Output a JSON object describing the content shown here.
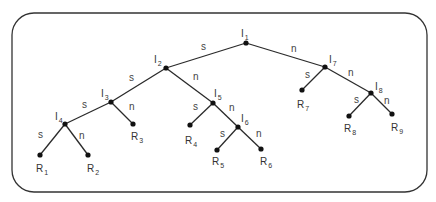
{
  "diagram": {
    "type": "binary-decision-tree",
    "border": {
      "x": 12,
      "y": 13,
      "w": 415,
      "h": 179,
      "radius": 22,
      "color": "#333333"
    },
    "internal_nodes": [
      {
        "id": "I1",
        "base": "I",
        "sub": "1",
        "x": 246,
        "y": 43,
        "lx": 241,
        "ly": 37
      },
      {
        "id": "I2",
        "base": "I",
        "sub": "2",
        "x": 166,
        "y": 68,
        "lx": 154,
        "ly": 63
      },
      {
        "id": "I3",
        "base": "I",
        "sub": "3",
        "x": 111,
        "y": 102,
        "lx": 101,
        "ly": 97
      },
      {
        "id": "I4",
        "base": "I",
        "sub": "4",
        "x": 65,
        "y": 124,
        "lx": 55,
        "ly": 120
      },
      {
        "id": "I5",
        "base": "I",
        "sub": "5",
        "x": 213,
        "y": 103,
        "lx": 214,
        "ly": 97
      },
      {
        "id": "I6",
        "base": "I",
        "sub": "6",
        "x": 238,
        "y": 127,
        "lx": 241,
        "ly": 122
      },
      {
        "id": "I7",
        "base": "I",
        "sub": "7",
        "x": 325,
        "y": 67,
        "lx": 329,
        "ly": 63
      },
      {
        "id": "I8",
        "base": "I",
        "sub": "8",
        "x": 371,
        "y": 93,
        "lx": 375,
        "ly": 90
      }
    ],
    "leaf_nodes": [
      {
        "id": "R1",
        "base": "R",
        "sub": "1",
        "x": 40,
        "y": 155,
        "lx": 36,
        "ly": 172
      },
      {
        "id": "R2",
        "base": "R",
        "sub": "2",
        "x": 88,
        "y": 155,
        "lx": 87,
        "ly": 172
      },
      {
        "id": "R3",
        "base": "R",
        "sub": "3",
        "x": 133,
        "y": 124,
        "lx": 131,
        "ly": 140
      },
      {
        "id": "R4",
        "base": "R",
        "sub": "4",
        "x": 190,
        "y": 125,
        "lx": 185,
        "ly": 144
      },
      {
        "id": "R5",
        "base": "R",
        "sub": "5",
        "x": 217,
        "y": 150,
        "lx": 212,
        "ly": 165
      },
      {
        "id": "R6",
        "base": "R",
        "sub": "6",
        "x": 261,
        "y": 149,
        "lx": 260,
        "ly": 165
      },
      {
        "id": "R7",
        "base": "R",
        "sub": "7",
        "x": 302,
        "y": 90,
        "lx": 297,
        "ly": 108
      },
      {
        "id": "R8",
        "base": "R",
        "sub": "8",
        "x": 349,
        "y": 116,
        "lx": 344,
        "ly": 132
      },
      {
        "id": "R9",
        "base": "R",
        "sub": "9",
        "x": 392,
        "y": 114,
        "lx": 391,
        "ly": 131
      }
    ],
    "edges": [
      {
        "from": "I1",
        "to": "I2",
        "label": "s",
        "lx": 201,
        "ly": 50
      },
      {
        "from": "I1",
        "to": "I7",
        "label": "n",
        "lx": 291,
        "ly": 52
      },
      {
        "from": "I2",
        "to": "I3",
        "label": "s",
        "lx": 129,
        "ly": 81
      },
      {
        "from": "I2",
        "to": "I5",
        "label": "n",
        "lx": 193,
        "ly": 80
      },
      {
        "from": "I3",
        "to": "I4",
        "label": "s",
        "lx": 82,
        "ly": 108
      },
      {
        "from": "I3",
        "to": "R3",
        "label": "n",
        "lx": 129,
        "ly": 110
      },
      {
        "from": "I4",
        "to": "R1",
        "label": "s",
        "lx": 38,
        "ly": 138
      },
      {
        "from": "I4",
        "to": "R2",
        "label": "n",
        "lx": 79,
        "ly": 139
      },
      {
        "from": "I5",
        "to": "R4",
        "label": "s",
        "lx": 193,
        "ly": 110
      },
      {
        "from": "I5",
        "to": "I6",
        "label": "n",
        "lx": 229,
        "ly": 111
      },
      {
        "from": "I6",
        "to": "R5",
        "label": "s",
        "lx": 220,
        "ly": 137
      },
      {
        "from": "I6",
        "to": "R6",
        "label": "n",
        "lx": 256,
        "ly": 137
      },
      {
        "from": "I7",
        "to": "R7",
        "label": "s",
        "lx": 305,
        "ly": 78
      },
      {
        "from": "I7",
        "to": "I8",
        "label": "n",
        "lx": 348,
        "ly": 76
      },
      {
        "from": "I8",
        "to": "R8",
        "label": "s",
        "lx": 354,
        "ly": 103
      },
      {
        "from": "I8",
        "to": "R9",
        "label": "n",
        "lx": 384,
        "ly": 104
      }
    ]
  }
}
